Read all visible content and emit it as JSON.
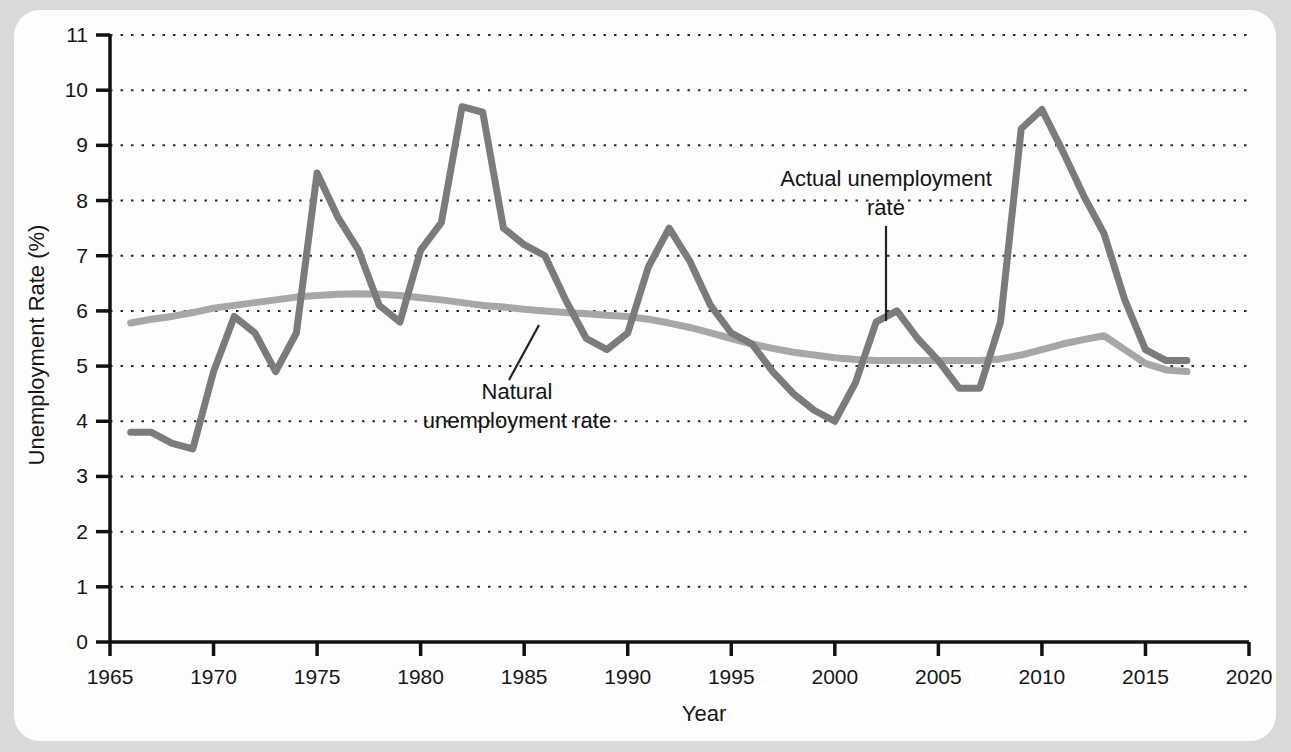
{
  "figure": {
    "background_color": "#d9d9d7",
    "panel_color": "#fdfdfd"
  },
  "axes": {
    "x_title": "Year",
    "y_title": "Unemployment Rate (%)",
    "x_ticks": [
      "1965",
      "1970",
      "1975",
      "1980",
      "1985",
      "1990",
      "1995",
      "2000",
      "2005",
      "2010",
      "2015",
      "2020"
    ],
    "y_ticks": [
      "0",
      "1",
      "2",
      "3",
      "4",
      "5",
      "6",
      "7",
      "8",
      "9",
      "10",
      "11"
    ]
  },
  "annotations": {
    "actual_line1": "Actual unemployment",
    "actual_line2": "rate",
    "natural_line1": "Natural",
    "natural_line2": "unemployment rate"
  },
  "chart_data": {
    "type": "line",
    "title": "",
    "xlabel": "Year",
    "ylabel": "Unemployment Rate (%)",
    "xlim": [
      1965,
      2020
    ],
    "ylim": [
      0,
      11
    ],
    "grid": "horizontal-dotted",
    "legend": "annotated-inline",
    "x": [
      1966,
      1967,
      1968,
      1969,
      1970,
      1971,
      1972,
      1973,
      1974,
      1975,
      1976,
      1977,
      1978,
      1979,
      1980,
      1981,
      1982,
      1983,
      1984,
      1985,
      1986,
      1987,
      1988,
      1989,
      1990,
      1991,
      1992,
      1993,
      1994,
      1995,
      1996,
      1997,
      1998,
      1999,
      2000,
      2001,
      2002,
      2003,
      2004,
      2005,
      2006,
      2007,
      2008,
      2009,
      2010,
      2011,
      2012,
      2013,
      2014,
      2015,
      2016,
      2017
    ],
    "series": [
      {
        "name": "Actual unemployment rate",
        "color": "#7b7b7b",
        "values": [
          3.8,
          3.8,
          3.6,
          3.5,
          4.9,
          5.9,
          5.6,
          4.9,
          5.6,
          8.5,
          7.7,
          7.1,
          6.1,
          5.8,
          7.1,
          7.6,
          9.7,
          9.6,
          7.5,
          7.2,
          7.0,
          6.2,
          5.5,
          5.3,
          5.6,
          6.8,
          7.5,
          6.9,
          6.1,
          5.6,
          5.4,
          4.9,
          4.5,
          4.2,
          4.0,
          4.7,
          5.8,
          6.0,
          5.5,
          5.1,
          4.6,
          4.6,
          5.8,
          9.3,
          9.65,
          8.9,
          8.1,
          7.4,
          6.2,
          5.3,
          5.1,
          5.1
        ]
      },
      {
        "name": "Natural unemployment rate",
        "color": "#a7a7a7",
        "values": [
          5.78,
          5.85,
          5.9,
          5.97,
          6.05,
          6.1,
          6.15,
          6.2,
          6.25,
          6.28,
          6.3,
          6.31,
          6.3,
          6.28,
          6.24,
          6.2,
          6.15,
          6.1,
          6.07,
          6.03,
          6.0,
          5.97,
          5.95,
          5.92,
          5.9,
          5.85,
          5.78,
          5.7,
          5.6,
          5.5,
          5.4,
          5.32,
          5.25,
          5.2,
          5.15,
          5.12,
          5.1,
          5.1,
          5.1,
          5.1,
          5.1,
          5.1,
          5.13,
          5.2,
          5.3,
          5.4,
          5.48,
          5.55,
          5.3,
          5.05,
          4.93,
          4.9
        ]
      }
    ]
  }
}
